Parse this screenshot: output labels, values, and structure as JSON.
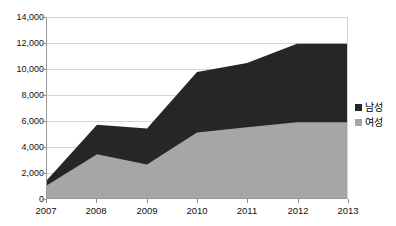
{
  "chart_data": {
    "type": "area",
    "title": "",
    "subtitle": "",
    "xlabel": "",
    "ylabel": "",
    "stacked": true,
    "grid": true,
    "legend_position": "right",
    "categories": [
      "2007",
      "2008",
      "2009",
      "2010",
      "2011",
      "2012",
      "2013"
    ],
    "x": [
      2007,
      2008,
      2009,
      2010,
      2011,
      2012,
      2013
    ],
    "ylim": [
      0,
      14000
    ],
    "ytick_labels": [
      "14,000",
      "12,000",
      "10,000",
      "8,000",
      "6,000",
      "4,000",
      "2,000",
      "0"
    ],
    "ytick_values": [
      14000,
      12000,
      10000,
      8000,
      6000,
      4000,
      2000,
      0
    ],
    "series": [
      {
        "name": "남성",
        "color": "#262626",
        "values": [
          1400,
          5700,
          5400,
          9800,
          10500,
          12000,
          12000
        ],
        "note": "cumulative top of stack (total)"
      },
      {
        "name": "여성",
        "color": "#a6a6a6",
        "values": [
          1000,
          3400,
          2600,
          5100,
          5500,
          5900,
          5900
        ],
        "note": "bottom band value"
      }
    ],
    "male_only_values": [
      400,
      2300,
      2800,
      4700,
      5000,
      6100,
      6100
    ]
  },
  "legend": {
    "items": [
      {
        "label": "남성",
        "color": "#262626",
        "swatch_icon": "square-swatch-icon"
      },
      {
        "label": "여성",
        "color": "#a6a6a6",
        "swatch_icon": "square-swatch-icon"
      }
    ]
  },
  "axes": {
    "y_labels": [
      "14,000",
      "12,000",
      "10,000",
      "8,000",
      "6,000",
      "4,000",
      "2,000",
      "0"
    ],
    "x_labels": [
      "2007",
      "2008",
      "2009",
      "2010",
      "2011",
      "2012",
      "2013"
    ]
  },
  "colors": {
    "male": "#262626",
    "female": "#a6a6a6",
    "gridline": "#d6d6d6",
    "axis": "#8f8f8f",
    "background": "#ffffff"
  },
  "title_strip": {
    "text": " "
  }
}
